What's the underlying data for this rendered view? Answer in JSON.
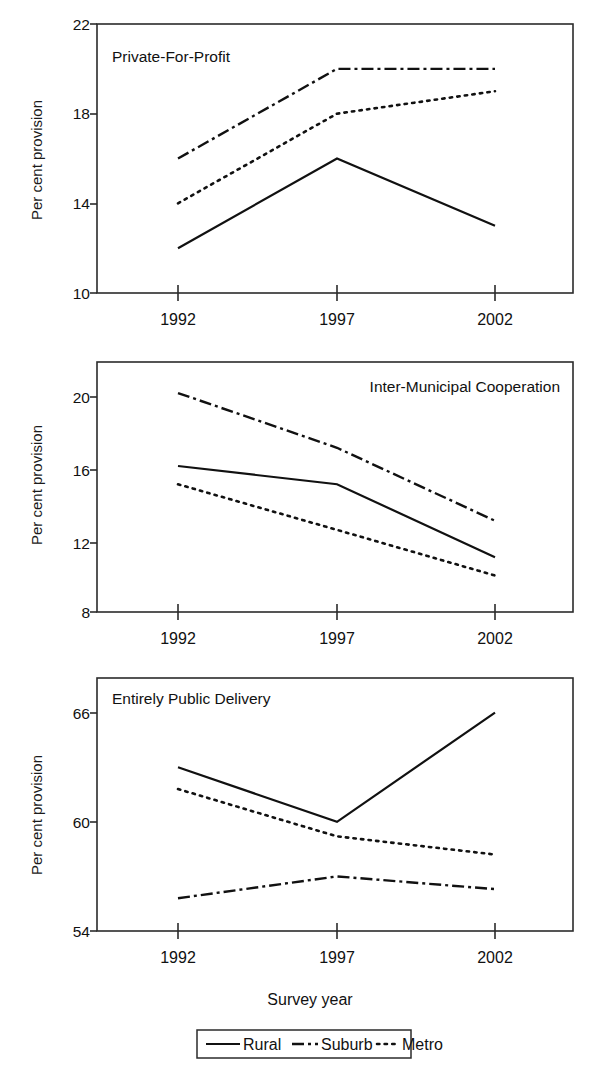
{
  "figure": {
    "xlabel": "Survey year",
    "ylabel": "Per cent provision",
    "categories": [
      "1992",
      "1997",
      "2002"
    ],
    "legend": {
      "position": "bottom-center",
      "entries": [
        {
          "label": "Rural",
          "style": "solid"
        },
        {
          "label": "Suburb",
          "style": "dash-dot"
        },
        {
          "label": "Metro",
          "style": "dotted"
        }
      ]
    },
    "ink_color": "#111111"
  },
  "chart_data": [
    {
      "type": "line",
      "title": "Private-For-Profit",
      "xlabel": "Survey year",
      "ylabel": "Per cent provision",
      "categories": [
        "1992",
        "1997",
        "2002"
      ],
      "ylim": [
        10,
        22
      ],
      "yticks": [
        10,
        14,
        18,
        22
      ],
      "ytick_labels": [
        "10",
        "14",
        "18",
        "22"
      ],
      "grid": false,
      "series": [
        {
          "name": "Rural",
          "style": "solid",
          "values": [
            12,
            16,
            13
          ]
        },
        {
          "name": "Suburb",
          "style": "dash-dot",
          "values": [
            16,
            20,
            20
          ]
        },
        {
          "name": "Metro",
          "style": "dotted",
          "values": [
            14,
            18,
            19
          ]
        }
      ]
    },
    {
      "type": "line",
      "title": "Inter-Municipal Cooperation",
      "xlabel": "Survey year",
      "ylabel": "Per cent provision",
      "categories": [
        "1992",
        "1997",
        "2002"
      ],
      "ylim": [
        8,
        21.7
      ],
      "yticks": [
        8,
        12,
        16,
        20
      ],
      "ytick_labels": [
        "8",
        "12",
        "16",
        "20"
      ],
      "grid": false,
      "series": [
        {
          "name": "Rural",
          "style": "solid",
          "values": [
            16,
            15,
            11
          ]
        },
        {
          "name": "Suburb",
          "style": "dash-dot",
          "values": [
            20,
            17,
            13
          ]
        },
        {
          "name": "Metro",
          "style": "dotted",
          "values": [
            15,
            12.5,
            10
          ]
        }
      ]
    },
    {
      "type": "line",
      "title": "Entirely Public Delivery",
      "xlabel": "Survey year",
      "ylabel": "Per cent provision",
      "categories": [
        "1992",
        "1997",
        "2002"
      ],
      "ylim": [
        54,
        67.9
      ],
      "yticks": [
        54,
        60,
        66
      ],
      "ytick_labels": [
        "54",
        "60",
        "66"
      ],
      "grid": false,
      "series": [
        {
          "name": "Rural",
          "style": "solid",
          "values": [
            63,
            60,
            66
          ]
        },
        {
          "name": "Suburb",
          "style": "dash-dot",
          "values": [
            55.8,
            57,
            56.3
          ]
        },
        {
          "name": "Metro",
          "style": "dotted",
          "values": [
            61.8,
            59.2,
            58.2
          ]
        }
      ]
    }
  ]
}
